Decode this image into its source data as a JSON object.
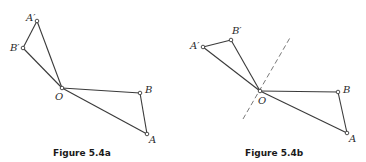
{
  "figures": [
    {
      "id": "fig-a",
      "caption": "Figure 5.4a",
      "points": {
        "A_prime": {
          "label": "A′",
          "x": 37,
          "y": 21
        },
        "B_prime": {
          "label": "B′",
          "x": 23,
          "y": 48
        },
        "O": {
          "label": "O",
          "x": 62,
          "y": 88
        },
        "B": {
          "label": "B",
          "x": 140,
          "y": 93
        },
        "A": {
          "label": "A",
          "x": 147,
          "y": 134
        }
      },
      "segments": [
        [
          "A_prime",
          "B_prime"
        ],
        [
          "A_prime",
          "O"
        ],
        [
          "B_prime",
          "O"
        ],
        [
          "O",
          "B"
        ],
        [
          "O",
          "A"
        ],
        [
          "B",
          "A"
        ]
      ],
      "axis": null
    },
    {
      "id": "fig-b",
      "caption": "Figure 5.4b",
      "points": {
        "A_prime": {
          "label": "A′",
          "x": 203,
          "y": 47
        },
        "B_prime": {
          "label": "B′",
          "x": 231,
          "y": 40
        },
        "O": {
          "label": "O",
          "x": 260,
          "y": 91
        },
        "B": {
          "label": "B",
          "x": 338,
          "y": 92
        },
        "A": {
          "label": "A",
          "x": 347,
          "y": 133
        }
      },
      "segments": [
        [
          "A_prime",
          "B_prime"
        ],
        [
          "A_prime",
          "O"
        ],
        [
          "B_prime",
          "O"
        ],
        [
          "O",
          "B"
        ],
        [
          "O",
          "A"
        ],
        [
          "B",
          "A"
        ]
      ],
      "axis": {
        "style": "dashed",
        "x1": 243,
        "y1": 119,
        "x2": 291,
        "y2": 36
      }
    }
  ]
}
